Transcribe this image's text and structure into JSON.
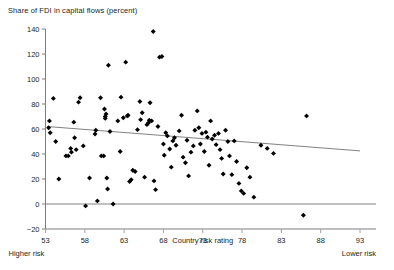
{
  "chart_data": {
    "type": "scatter",
    "title": "Share of FDI in capital flows (percent)",
    "xlabel": "Country risk rating",
    "ylabel": "",
    "xlim": [
      53,
      93
    ],
    "ylim": [
      -20,
      140
    ],
    "xticks": [
      53,
      58,
      63,
      68,
      73,
      78,
      83,
      88,
      93
    ],
    "yticks": [
      -20,
      0,
      20,
      40,
      60,
      80,
      100,
      120,
      140
    ],
    "grid": false,
    "legend": null,
    "annotations": {
      "x_axis_left_note": "Higher risk",
      "x_axis_right_note": "Lower risk"
    },
    "zero_line": 0,
    "trendline": {
      "type": "linear",
      "x": [
        53.2,
        93.0
      ],
      "y": [
        62.0,
        42.5
      ]
    },
    "marker": {
      "shape": "diamond",
      "color": "#000000",
      "size": 4
    },
    "points": [
      [
        53.4,
        61.0
      ],
      [
        53.5,
        66.5
      ],
      [
        53.6,
        57.0
      ],
      [
        54.0,
        84.5
      ],
      [
        54.3,
        50.0
      ],
      [
        54.7,
        20.0
      ],
      [
        55.6,
        38.5
      ],
      [
        55.9,
        38.5
      ],
      [
        56.2,
        44.5
      ],
      [
        56.3,
        41.5
      ],
      [
        56.6,
        65.5
      ],
      [
        56.7,
        53.0
      ],
      [
        56.9,
        43.5
      ],
      [
        57.2,
        81.5
      ],
      [
        57.4,
        85.0
      ],
      [
        57.8,
        46.5
      ],
      [
        58.1,
        -1.5
      ],
      [
        58.6,
        20.8
      ],
      [
        59.3,
        56.0
      ],
      [
        59.4,
        59.0
      ],
      [
        59.6,
        2.5
      ],
      [
        60.0,
        85.0
      ],
      [
        60.1,
        38.5
      ],
      [
        60.4,
        38.5
      ],
      [
        60.5,
        76.0
      ],
      [
        60.6,
        68.5
      ],
      [
        60.6,
        70.0
      ],
      [
        60.7,
        72.0
      ],
      [
        60.8,
        20.8
      ],
      [
        60.9,
        12.0
      ],
      [
        61.0,
        111.0
      ],
      [
        61.2,
        58.0
      ],
      [
        61.6,
        0.0
      ],
      [
        62.2,
        66.5
      ],
      [
        62.5,
        42.0
      ],
      [
        62.6,
        85.5
      ],
      [
        62.9,
        69.0
      ],
      [
        63.2,
        113.5
      ],
      [
        63.4,
        70.5
      ],
      [
        63.5,
        71.0
      ],
      [
        63.7,
        18.0
      ],
      [
        63.9,
        19.5
      ],
      [
        64.1,
        27.0
      ],
      [
        64.4,
        26.0
      ],
      [
        64.7,
        59.5
      ],
      [
        65.0,
        82.0
      ],
      [
        65.1,
        67.5
      ],
      [
        65.3,
        73.0
      ],
      [
        65.6,
        21.5
      ],
      [
        65.9,
        63.5
      ],
      [
        66.1,
        65.0
      ],
      [
        66.2,
        67.0
      ],
      [
        66.3,
        81.0
      ],
      [
        66.5,
        66.5
      ],
      [
        66.7,
        138.0
      ],
      [
        66.8,
        18.5
      ],
      [
        67.0,
        11.5
      ],
      [
        67.3,
        62.0
      ],
      [
        67.5,
        117.5
      ],
      [
        67.8,
        118.0
      ],
      [
        68.0,
        48.0
      ],
      [
        68.1,
        39.0
      ],
      [
        68.3,
        57.0
      ],
      [
        68.5,
        54.5
      ],
      [
        68.8,
        44.0
      ],
      [
        69.0,
        29.5
      ],
      [
        69.2,
        50.5
      ],
      [
        69.4,
        53.0
      ],
      [
        69.6,
        47.0
      ],
      [
        70.0,
        58.5
      ],
      [
        70.3,
        71.0
      ],
      [
        70.5,
        37.5
      ],
      [
        70.8,
        33.0
      ],
      [
        71.0,
        51.0
      ],
      [
        71.2,
        22.5
      ],
      [
        71.5,
        41.5
      ],
      [
        71.8,
        46.5
      ],
      [
        72.0,
        59.0
      ],
      [
        72.3,
        74.5
      ],
      [
        72.5,
        61.0
      ],
      [
        72.7,
        48.0
      ],
      [
        72.9,
        56.5
      ],
      [
        73.2,
        42.0
      ],
      [
        73.4,
        57.5
      ],
      [
        73.6,
        53.5
      ],
      [
        73.8,
        31.0
      ],
      [
        74.0,
        66.5
      ],
      [
        74.2,
        52.0
      ],
      [
        74.5,
        55.0
      ],
      [
        74.7,
        47.5
      ],
      [
        75.0,
        56.5
      ],
      [
        75.2,
        43.5
      ],
      [
        75.4,
        36.5
      ],
      [
        75.6,
        24.0
      ],
      [
        75.9,
        59.0
      ],
      [
        76.2,
        50.0
      ],
      [
        76.4,
        38.5
      ],
      [
        76.7,
        23.5
      ],
      [
        77.0,
        50.5
      ],
      [
        77.3,
        34.0
      ],
      [
        77.6,
        16.5
      ],
      [
        77.9,
        10.5
      ],
      [
        78.2,
        8.5
      ],
      [
        78.6,
        29.0
      ],
      [
        79.0,
        21.5
      ],
      [
        79.5,
        5.5
      ],
      [
        80.4,
        47.0
      ],
      [
        81.2,
        44.5
      ],
      [
        82.0,
        40.5
      ],
      [
        85.8,
        -9.0
      ],
      [
        86.2,
        70.5
      ]
    ]
  }
}
